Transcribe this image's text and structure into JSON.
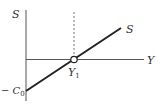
{
  "diagram": {
    "y_axis_label": "S",
    "x_axis_label": "Y",
    "line_label": "S",
    "intersection_label": "Y",
    "intersection_subscript": "1",
    "intercept_label_prefix": "− C",
    "intercept_subscript": "0",
    "colors": {
      "axis": "#555555",
      "line": "#222222",
      "dashed": "#777777",
      "text": "#333333"
    }
  }
}
